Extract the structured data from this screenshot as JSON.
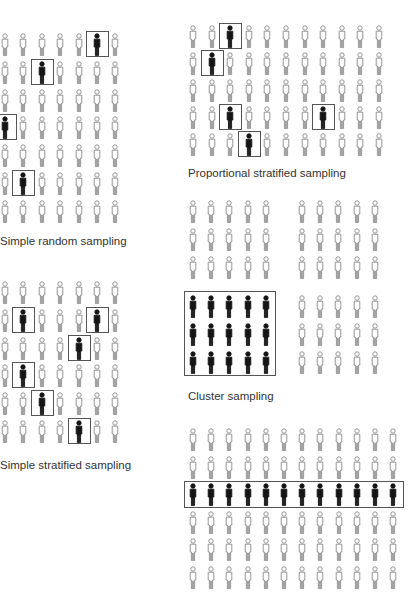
{
  "colors": {
    "unselected_stroke": "#8a8a8a",
    "selected_fill": "#151515",
    "box_border": "#555555",
    "caption": "#333333"
  },
  "panels": {
    "simple_random": {
      "caption": "Simple random sampling",
      "rows": 7,
      "cols": 7,
      "origin": [
        5,
        45
      ],
      "pitch": [
        18.4,
        27.8
      ],
      "selected": [
        [
          0,
          5
        ],
        [
          1,
          2
        ],
        [
          3,
          0
        ],
        [
          5,
          1
        ]
      ],
      "caption_pos": [
        0,
        235
      ]
    },
    "simple_stratified": {
      "caption": "Simple stratified sampling",
      "rows": 6,
      "cols": 7,
      "origin": [
        5,
        293
      ],
      "pitch": [
        18.4,
        27.8
      ],
      "selected": [
        [
          1,
          1
        ],
        [
          1,
          5
        ],
        [
          2,
          4
        ],
        [
          3,
          1
        ],
        [
          4,
          2
        ],
        [
          5,
          4
        ]
      ],
      "caption_pos": [
        0,
        459
      ]
    },
    "proportional_stratified": {
      "caption": "Proportional stratified sampling",
      "rows": 5,
      "cols": 11,
      "origin": [
        193,
        37
      ],
      "pitch": [
        18.6,
        27
      ],
      "selected": [
        [
          0,
          2
        ],
        [
          1,
          1
        ],
        [
          3,
          2
        ],
        [
          3,
          7
        ],
        [
          4,
          3
        ]
      ],
      "caption_pos": [
        188,
        167
      ]
    },
    "cluster": {
      "caption": "Cluster sampling",
      "clusters": [
        {
          "origin": [
            193,
            212
          ],
          "rows": 3,
          "cols": 5,
          "selected": false
        },
        {
          "origin": [
            302,
            212
          ],
          "rows": 3,
          "cols": 5,
          "selected": false
        },
        {
          "origin": [
            193,
            307
          ],
          "rows": 3,
          "cols": 5,
          "selected": true
        },
        {
          "origin": [
            302,
            307
          ],
          "rows": 3,
          "cols": 5,
          "selected": false
        }
      ],
      "pitch": [
        18.2,
        28
      ],
      "caption_pos": [
        188,
        390
      ]
    },
    "systematic": {
      "caption": "",
      "rows": 6,
      "cols": 12,
      "origin": [
        193,
        440
      ],
      "pitch": [
        18.2,
        27.5
      ],
      "selected_row": 2
    }
  }
}
